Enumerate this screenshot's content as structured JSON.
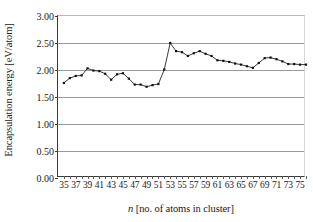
{
  "chart_data": {
    "type": "line",
    "title": "",
    "xlabel": "n [no. of atoms in cluster]",
    "xlabel_italic_prefix": "n",
    "xlabel_rest": " [no. of atoms in cluster]",
    "ylabel": "Encapsulation energy [eV/atom]",
    "xlim": [
      34,
      76
    ],
    "ylim": [
      0.0,
      3.0
    ],
    "ytick_labels": [
      "0.00",
      "0.50",
      "1.00",
      "1.50",
      "2.00",
      "2.50",
      "3.00"
    ],
    "ytick_values": [
      0.0,
      0.5,
      1.0,
      1.5,
      2.0,
      2.5,
      3.0
    ],
    "xtick_labels": [
      "35",
      "37",
      "39",
      "41",
      "43",
      "45",
      "47",
      "49",
      "51",
      "53",
      "55",
      "57",
      "59",
      "61",
      "63",
      "65",
      "67",
      "69",
      "71",
      "73",
      "75"
    ],
    "xtick_values": [
      35,
      37,
      39,
      41,
      43,
      45,
      47,
      49,
      51,
      53,
      55,
      57,
      59,
      61,
      63,
      65,
      67,
      69,
      71,
      73,
      75
    ],
    "minor_xticks": [
      36,
      38,
      40,
      42,
      44,
      46,
      48,
      50,
      52,
      54,
      56,
      58,
      60,
      62,
      64,
      66,
      68,
      70,
      72,
      74,
      76
    ],
    "grid": "horizontal",
    "legend": "none",
    "marker": "filled-square",
    "line_color": "#222222",
    "marker_color": "#111111",
    "grid_color": "#9a9a9a",
    "x": [
      35,
      36,
      37,
      38,
      39,
      40,
      41,
      42,
      43,
      44,
      45,
      46,
      47,
      48,
      49,
      50,
      51,
      52,
      53,
      54,
      55,
      56,
      57,
      58,
      59,
      60,
      61,
      62,
      63,
      64,
      65,
      66,
      67,
      68,
      69,
      70,
      71,
      72,
      73,
      74,
      75,
      76
    ],
    "values": [
      1.76,
      1.85,
      1.89,
      1.9,
      2.03,
      1.99,
      1.98,
      1.93,
      1.82,
      1.92,
      1.94,
      1.84,
      1.73,
      1.73,
      1.69,
      1.72,
      1.74,
      2.01,
      2.5,
      2.35,
      2.33,
      2.26,
      2.31,
      2.35,
      2.3,
      2.26,
      2.18,
      2.17,
      2.15,
      2.12,
      2.1,
      2.07,
      2.04,
      2.13,
      2.22,
      2.23,
      2.2,
      2.16,
      2.11,
      2.11,
      2.1,
      2.1
    ]
  }
}
